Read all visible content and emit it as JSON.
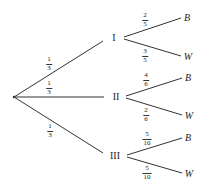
{
  "diagram": {
    "type": "probability-tree",
    "root": {
      "x": 14,
      "y": 97
    },
    "line_color": "#333333",
    "first_level": [
      {
        "label": "I",
        "pos": {
          "x": 114,
          "y": 38
        },
        "branch_prob": {
          "num": "1",
          "den": "3"
        },
        "children": [
          {
            "label": "B",
            "pos": {
              "x": 187,
              "y": 18
            },
            "prob": {
              "num": "2",
              "den": "5"
            }
          },
          {
            "label": "W",
            "pos": {
              "x": 187,
              "y": 56
            },
            "prob": {
              "num": "3",
              "den": "5"
            }
          }
        ]
      },
      {
        "label": "II",
        "pos": {
          "x": 116,
          "y": 97
        },
        "branch_prob": {
          "num": "1",
          "den": "3"
        },
        "children": [
          {
            "label": "B",
            "pos": {
              "x": 188,
              "y": 78
            },
            "prob": {
              "num": "4",
              "den": "6"
            }
          },
          {
            "label": "W",
            "pos": {
              "x": 188,
              "y": 115
            },
            "prob": {
              "num": "2",
              "den": "6"
            }
          }
        ]
      },
      {
        "label": "III",
        "pos": {
          "x": 115,
          "y": 156
        },
        "branch_prob": {
          "num": "1",
          "den": "3"
        },
        "children": [
          {
            "label": "B",
            "pos": {
              "x": 188,
              "y": 138
            },
            "prob": {
              "num": "5",
              "den": "10"
            }
          },
          {
            "label": "W",
            "pos": {
              "x": 188,
              "y": 173
            },
            "prob": {
              "num": "5",
              "den": "10"
            }
          }
        ]
      }
    ]
  }
}
